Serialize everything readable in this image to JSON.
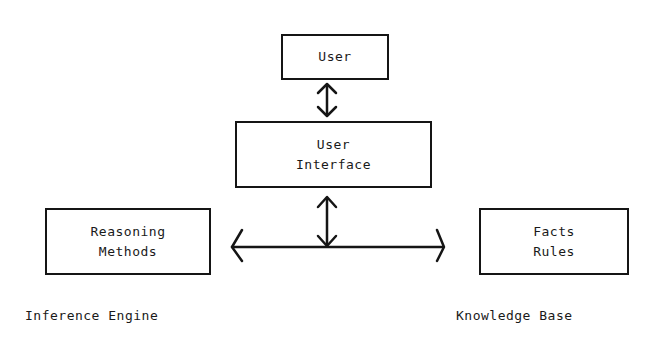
{
  "diagram": {
    "nodes": {
      "user": {
        "lines": [
          "User"
        ]
      },
      "user_interface": {
        "lines": [
          "User",
          "Interface"
        ]
      },
      "inference_engine": {
        "lines": [
          "Reasoning",
          "Methods"
        ],
        "caption": "Inference Engine"
      },
      "knowledge_base": {
        "lines": [
          "Facts",
          "Rules"
        ],
        "caption": "Knowledge Base"
      }
    },
    "edges": [
      {
        "from": "user",
        "to": "user_interface",
        "type": "bidirectional"
      },
      {
        "from": "user_interface",
        "to": "connector-bus",
        "type": "bidirectional"
      },
      {
        "from": "inference_engine",
        "to": "knowledge_base",
        "type": "bidirectional",
        "via": "connector-bus"
      }
    ],
    "colors": {
      "ink": "#151515",
      "background": "#ffffff"
    }
  }
}
